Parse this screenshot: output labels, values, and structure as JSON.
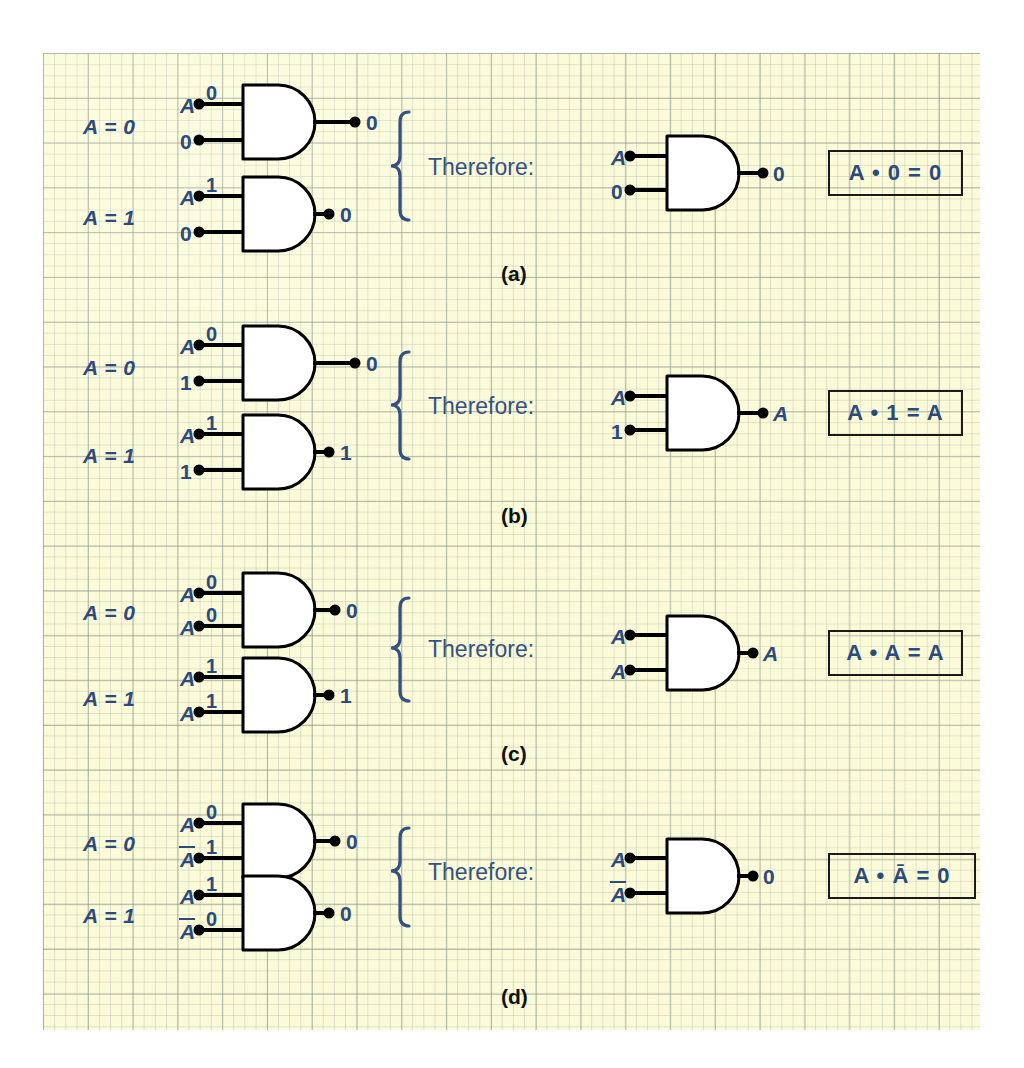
{
  "figure": {
    "type": "logic-gate-rules-diagram",
    "gate_type": "AND",
    "paper_color": "#fbfbd9",
    "ink_color": "#2d4a7a",
    "line_color": "#000000",
    "therefore_label": "Therefore:",
    "caption": ""
  },
  "sections": [
    {
      "id": "a",
      "section_label": "(a)",
      "rows": [
        {
          "condition": "A = 0",
          "inputs": [
            {
              "name": "A",
              "italic": true,
              "bit": "0"
            },
            {
              "name": "0",
              "italic": false,
              "bit": ""
            }
          ],
          "output": "0"
        },
        {
          "condition": "A = 1",
          "inputs": [
            {
              "name": "A",
              "italic": true,
              "bit": "1"
            },
            {
              "name": "0",
              "italic": false,
              "bit": ""
            }
          ],
          "output": "0"
        }
      ],
      "conclusion": {
        "inputs": [
          {
            "name": "A",
            "italic": true
          },
          {
            "name": "0",
            "italic": false
          }
        ],
        "output": "0",
        "output_italic": false
      },
      "law": {
        "lhs_var": "A",
        "operator": "•",
        "rhs": "0",
        "equals": "=",
        "result": "0",
        "text": "A • 0 = 0"
      }
    },
    {
      "id": "b",
      "section_label": "(b)",
      "rows": [
        {
          "condition": "A = 0",
          "inputs": [
            {
              "name": "A",
              "italic": true,
              "bit": "0"
            },
            {
              "name": "1",
              "italic": false,
              "bit": ""
            }
          ],
          "output": "0"
        },
        {
          "condition": "A = 1",
          "inputs": [
            {
              "name": "A",
              "italic": true,
              "bit": "1"
            },
            {
              "name": "1",
              "italic": false,
              "bit": ""
            }
          ],
          "output": "1"
        }
      ],
      "conclusion": {
        "inputs": [
          {
            "name": "A",
            "italic": true
          },
          {
            "name": "1",
            "italic": false
          }
        ],
        "output": "A",
        "output_italic": true
      },
      "law": {
        "lhs_var": "A",
        "operator": "•",
        "rhs": "1",
        "equals": "=",
        "result": "A",
        "text": "A • 1 = A"
      }
    },
    {
      "id": "c",
      "section_label": "(c)",
      "rows": [
        {
          "condition": "A = 0",
          "inputs": [
            {
              "name": "A",
              "italic": true,
              "bit": "0"
            },
            {
              "name": "A",
              "italic": true,
              "bit": "0"
            }
          ],
          "output": "0"
        },
        {
          "condition": "A = 1",
          "inputs": [
            {
              "name": "A",
              "italic": true,
              "bit": "1"
            },
            {
              "name": "A",
              "italic": true,
              "bit": "1"
            }
          ],
          "output": "1"
        }
      ],
      "conclusion": {
        "inputs": [
          {
            "name": "A",
            "italic": true
          },
          {
            "name": "A",
            "italic": true
          }
        ],
        "output": "A",
        "output_italic": true
      },
      "law": {
        "lhs_var": "A",
        "operator": "•",
        "rhs": "A",
        "equals": "=",
        "result": "A",
        "text": "A • A = A"
      }
    },
    {
      "id": "d",
      "section_label": "(d)",
      "rows": [
        {
          "condition": "A = 0",
          "inputs": [
            {
              "name": "A",
              "italic": true,
              "overline": false,
              "bit": "0"
            },
            {
              "name": "A",
              "italic": true,
              "overline": true,
              "bit": "1"
            }
          ],
          "output": "0"
        },
        {
          "condition": "A = 1",
          "inputs": [
            {
              "name": "A",
              "italic": true,
              "overline": false,
              "bit": "1"
            },
            {
              "name": "A",
              "italic": true,
              "overline": true,
              "bit": "0"
            }
          ],
          "output": "0"
        }
      ],
      "conclusion": {
        "inputs": [
          {
            "name": "A",
            "italic": true,
            "overline": false
          },
          {
            "name": "A",
            "italic": true,
            "overline": true
          }
        ],
        "output": "0",
        "output_italic": false
      },
      "law": {
        "lhs_var": "A",
        "operator": "•",
        "rhs": "A",
        "rhs_overline": true,
        "equals": "=",
        "result": "0",
        "text": "A • Ā = 0"
      }
    }
  ]
}
